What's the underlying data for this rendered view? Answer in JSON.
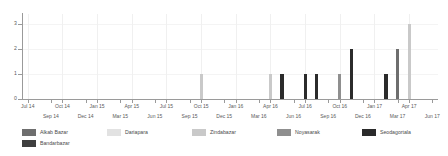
{
  "chart_data": {
    "type": "bar",
    "title": "",
    "subtitle": "",
    "xlabel": "",
    "ylabel": "",
    "ylim": [
      0,
      3.4
    ],
    "yticks": [
      0,
      1,
      2,
      3
    ],
    "ytick_labels": [
      "0",
      "1",
      "2",
      "3"
    ],
    "grid": true,
    "legend_position": "bottom",
    "x_axis_range": [
      "Jul 14",
      "Jun 17"
    ],
    "x_tick_labels_top": [
      "Jul 14",
      "Oct 14",
      "Jan 15",
      "Apr 15",
      "Jul 15",
      "Oct 15",
      "Jan 16",
      "Apr 16",
      "Jul 16",
      "Oct 16",
      "Jan 17",
      "Apr 17"
    ],
    "x_tick_labels_bottom": [
      "Sep 14",
      "Dec 14",
      "Mar 15",
      "Jun 15",
      "Sep 15",
      "Dec 15",
      "Mar 16",
      "Jun 16",
      "Sep 16",
      "Dec 16",
      "Mar 17",
      "Jun 17"
    ],
    "series": [
      {
        "name": "Alkab Bazar",
        "color": "#6e6e6e",
        "values": []
      },
      {
        "name": "Dariapara",
        "color": "#e2e2e2",
        "values": []
      },
      {
        "name": "Zindabazar",
        "color": "#c9c9c9",
        "values": []
      },
      {
        "name": "Noyasarak",
        "color": "#8f8f8f",
        "values": []
      },
      {
        "name": "Seodagortala",
        "color": "#2b2b2b",
        "values": []
      },
      {
        "name": "Bandarbazar",
        "color": "#3f3f3f",
        "values": []
      }
    ],
    "bars": [
      {
        "month": "Oct 15",
        "value": 1,
        "color": "#c9c9c9",
        "series": "Zindabazar"
      },
      {
        "month": "Apr 16",
        "value": 1,
        "color": "#c9c9c9",
        "series": "Zindabazar"
      },
      {
        "month": "May 16",
        "value": 1,
        "color": "#2b2b2b",
        "series": "Seodagortala"
      },
      {
        "month": "Jul 16",
        "value": 1,
        "color": "#2b2b2b",
        "series": "Seodagortala"
      },
      {
        "month": "Aug 16",
        "value": 1,
        "color": "#2b2b2b",
        "series": "Seodagortala"
      },
      {
        "month": "Oct 16",
        "value": 1,
        "color": "#8f8f8f",
        "series": "Noyasarak"
      },
      {
        "month": "Nov 16",
        "value": 2,
        "color": "#2b2b2b",
        "series": "Seodagortala"
      },
      {
        "month": "Feb 17",
        "value": 1,
        "color": "#2b2b2b",
        "series": "Seodagortala"
      },
      {
        "month": "Mar 17",
        "value": 2,
        "color": "#6e6e6e",
        "series": "Alkab Bazar"
      },
      {
        "month": "Apr 17",
        "value": 3,
        "color": "#c9c9c9",
        "series": "Zindabazar"
      }
    ]
  },
  "legend": {
    "rows": [
      [
        {
          "label": "Alkab Bazar",
          "color": "#6e6e6e"
        },
        {
          "label": "Dariapara",
          "color": "#e2e2e2"
        },
        {
          "label": "Zindabazar",
          "color": "#c9c9c9"
        },
        {
          "label": "Noyasarak",
          "color": "#8f8f8f"
        },
        {
          "label": "Seodagortala",
          "color": "#2b2b2b"
        }
      ],
      [
        {
          "label": "Bandarbazar",
          "color": "#3f3f3f"
        }
      ]
    ]
  }
}
